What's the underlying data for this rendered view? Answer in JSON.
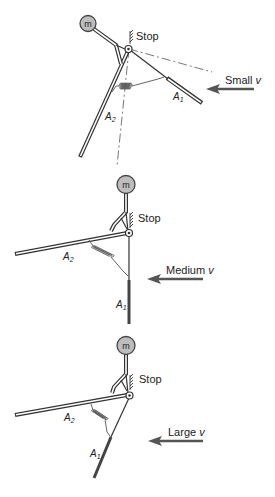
{
  "figure": {
    "panels": [
      {
        "id": "small",
        "mass_label": "m",
        "stop_label": "Stop",
        "arm1_label": "A",
        "arm1_sub": "1",
        "arm2_label": "A",
        "arm2_sub": "2",
        "velocity_label": "Small v",
        "velocity_word": "Small",
        "velocity_symbol": "v"
      },
      {
        "id": "medium",
        "mass_label": "m",
        "stop_label": "Stop",
        "arm1_label": "A",
        "arm1_sub": "1",
        "arm2_label": "A",
        "arm2_sub": "2",
        "velocity_label": "Medium v",
        "velocity_word": "Medium",
        "velocity_symbol": "v"
      },
      {
        "id": "large",
        "mass_label": "m",
        "stop_label": "Stop",
        "arm1_label": "A",
        "arm1_sub": "1",
        "arm2_label": "A",
        "arm2_sub": "2",
        "velocity_label": "Large v",
        "velocity_word": "Large",
        "velocity_symbol": "v"
      }
    ],
    "colors": {
      "line": "#333333",
      "mass_fill": "#bdbdbd",
      "arrow": "#555555",
      "background": "#ffffff"
    }
  }
}
